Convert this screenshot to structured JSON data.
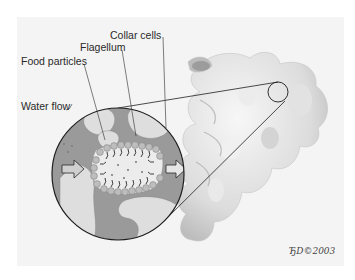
{
  "figure": {
    "labels": {
      "collar_cells": "Collar cells",
      "flagellum": "Flagellum",
      "food_particles": "Food particles",
      "water_flow": "Water flow"
    },
    "signature": "ЂD©2003",
    "colors": {
      "background": "#ffffff",
      "panel": "#f4f4f4",
      "water_channel": "#9a9a9a",
      "tissue": "#dedede",
      "sponge_body": "#e6e6e6",
      "outline": "#1e1e1e"
    }
  }
}
